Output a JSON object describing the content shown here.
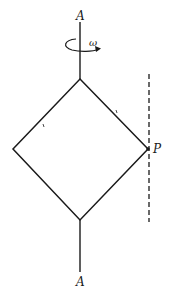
{
  "figure": {
    "labels": {
      "axis_top": "A",
      "axis_bottom": "A",
      "angular_velocity": "ω",
      "point": "P"
    },
    "colors": {
      "stroke": "#1a1a1a",
      "background": "#ffffff"
    }
  }
}
